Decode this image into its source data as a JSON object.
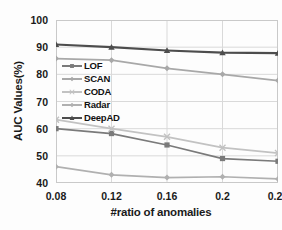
{
  "chart_data": {
    "type": "line",
    "title": "",
    "xlabel": "#ratio of anomalies",
    "ylabel": "AUC Values(%)",
    "x": [
      0.08,
      0.12,
      0.16,
      0.2,
      0.24
    ],
    "categories": [
      "0.08",
      "0.12",
      "0.16",
      "0.2",
      "0.24"
    ],
    "xtick_labels": [
      "0.08",
      "0.12",
      "0.16",
      "0.2",
      "0.24"
    ],
    "ytick_labels": [
      "100",
      "90",
      "80",
      "70",
      "60",
      "50",
      "40"
    ],
    "yticks": [
      100,
      90,
      80,
      70,
      60,
      50,
      40
    ],
    "xlim": [
      0.08,
      0.24
    ],
    "ylim": [
      40,
      100
    ],
    "grid": true,
    "legend_position": "center-left",
    "series": [
      {
        "name": "LOF",
        "values": [
          60.0,
          58.2,
          54.0,
          49.0,
          48.0
        ],
        "color": "#7a7a7a",
        "marker": "square"
      },
      {
        "name": "SCAN",
        "values": [
          85.8,
          85.2,
          82.2,
          80.0,
          77.7
        ],
        "color": "#a8a8a8",
        "marker": "diamond"
      },
      {
        "name": "CODA",
        "values": [
          63.3,
          60.0,
          57.0,
          53.0,
          51.0
        ],
        "color": "#c2c2c2",
        "marker": "cross"
      },
      {
        "name": "Radar",
        "values": [
          46.0,
          43.0,
          42.0,
          42.3,
          41.5
        ],
        "color": "#b0b0b0",
        "marker": "diamond"
      },
      {
        "name": "DeepAD",
        "values": [
          91.0,
          90.0,
          88.8,
          88.0,
          87.8
        ],
        "color": "#4d4d4d",
        "marker": "triangle"
      }
    ]
  },
  "legend": {
    "items": [
      {
        "label": "LOF"
      },
      {
        "label": "SCAN"
      },
      {
        "label": "CODA"
      },
      {
        "label": "Radar"
      },
      {
        "label": "DeepAD"
      }
    ]
  },
  "axes": {
    "y_title": "AUC Values(%)",
    "x_title": "#ratio of anomalies"
  },
  "colors": {
    "grid": "#d9d9d9",
    "frame": "#c9c9c9",
    "text": "#1a1a1a",
    "background": "#fdfdfd"
  }
}
